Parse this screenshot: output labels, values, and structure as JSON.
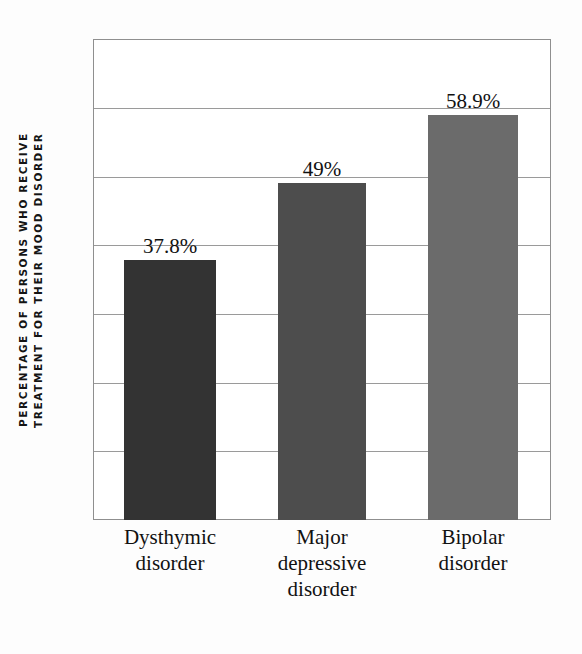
{
  "chart_data": {
    "type": "bar",
    "title": "",
    "subtitle": "",
    "xlabel": "",
    "ylabel": "PERCENTAGE OF PERSONS WHO RECEIVE TREATMENT FOR THEIR MOOD DISORDER",
    "ylabel_line1": "PERCENTAGE OF PERSONS WHO RECEIVE",
    "ylabel_line2": "TREATMENT FOR THEIR MOOD DISORDER",
    "categories": [
      "Dysthymic disorder",
      "Major depressive disorder",
      "Bipolar disorder"
    ],
    "category_lines": [
      [
        "Dysthymic",
        "disorder"
      ],
      [
        "Major",
        "depressive",
        "disorder"
      ],
      [
        "Bipolar",
        "disorder"
      ]
    ],
    "values": [
      37.8,
      49,
      58.9
    ],
    "value_labels": [
      "37.8%",
      "49%",
      "58.9%"
    ],
    "bar_colors": [
      "#333333",
      "#4d4d4d",
      "#6b6b6b"
    ],
    "ylim": [
      0,
      70
    ],
    "ytick_values": [
      0,
      10,
      20,
      30,
      40,
      50,
      60,
      70
    ],
    "ytick_labels": [
      "",
      "",
      "",
      "",
      "",
      "",
      "",
      ""
    ],
    "grid": true,
    "grid_color": "#9a9a9a",
    "legend": "none",
    "legend_position": "none",
    "plot_border_color": "#8f8f8f",
    "background_color": "#ffffff"
  }
}
